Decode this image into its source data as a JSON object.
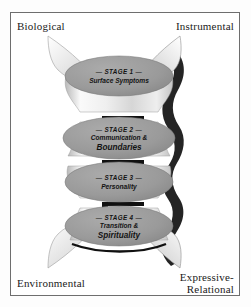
{
  "figure": {
    "axis_labels": {
      "top_left": "Biological",
      "top_right": "Instrumental",
      "bottom_left": "Environmental",
      "bottom_right": "Expressive-\nRelational"
    },
    "stages": [
      {
        "id": "stage-1",
        "heading": "— STAGE 1 —",
        "lines": [
          "Surface Symptoms"
        ]
      },
      {
        "id": "stage-2",
        "heading": "— STAGE 2 —",
        "lines": [
          "Communication &",
          "Boundaries"
        ]
      },
      {
        "id": "stage-3",
        "heading": "— STAGE 3 —",
        "lines": [
          "Personality"
        ]
      },
      {
        "id": "stage-4",
        "heading": "— STAGE 4 —",
        "lines": [
          "Transition &",
          "Spirituality"
        ]
      }
    ],
    "colors": {
      "frame_border": "#6e6e6e",
      "page_background": "#ffffff",
      "disc_fill": "#9a9a9a",
      "disc_edge": "#7d7d7d",
      "column_light": "#f4f4f4",
      "column_mid": "#c9c9c9",
      "shadow": "#111111",
      "text": "#1a1a1a",
      "wing_light": "#ededed",
      "wing_dark": "#8c8c8c"
    }
  }
}
